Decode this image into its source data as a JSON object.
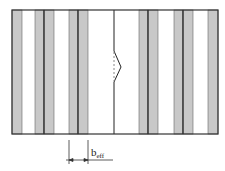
{
  "diagram": {
    "colors": {
      "outline": "#333333",
      "strip_fill": "#c8c8c8",
      "background": "#ffffff"
    },
    "frame": {
      "x": 12,
      "y": 10,
      "width": 206,
      "height": 124
    },
    "strips": [
      {
        "x": 12,
        "w": 10
      },
      {
        "x": 35,
        "w": 9
      },
      {
        "x": 44,
        "w": 10
      },
      {
        "x": 69,
        "w": 9
      },
      {
        "x": 78,
        "w": 10
      },
      {
        "x": 139,
        "w": 9
      },
      {
        "x": 148,
        "w": 10
      },
      {
        "x": 174,
        "w": 9
      },
      {
        "x": 183,
        "w": 10
      },
      {
        "x": 208,
        "w": 10
      }
    ],
    "dark_lines": [
      44,
      78,
      114,
      148,
      183
    ],
    "crack": {
      "x": 114,
      "y_start": 51,
      "apex_x": 121,
      "apex_y": 67,
      "y_end": 82
    },
    "dimension": {
      "label_main": "b",
      "label_sub": "eff",
      "x1": 69,
      "x2": 88,
      "y": 160
    }
  }
}
